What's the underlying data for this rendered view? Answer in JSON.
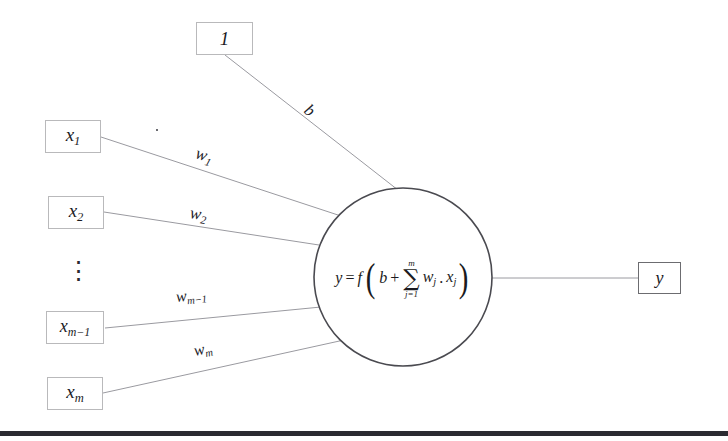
{
  "diagram": {
    "background_color": "#ffffff",
    "line_color": "#9a9aa0",
    "box_border_color": "#b9b9bb",
    "text_color": "#1b1b1f"
  },
  "bias_node": {
    "label": "1",
    "weight_label": "b"
  },
  "inputs": [
    {
      "name": "x",
      "subscript": "1",
      "weight_base": "w",
      "weight_subscript": "1"
    },
    {
      "name": "x",
      "subscript": "2",
      "weight_base": "w",
      "weight_subscript": "2"
    },
    {
      "name": "x",
      "subscript": "m−1",
      "weight_base": "w",
      "weight_subscript": "m−1"
    },
    {
      "name": "x",
      "subscript": "m",
      "weight_base": "w",
      "weight_subscript": "m"
    }
  ],
  "ellipsis": "⋮",
  "neuron": {
    "output_var": "y",
    "equals": "=",
    "function": "f",
    "open_paren": "(",
    "close_paren": ")",
    "bias_term": "b",
    "plus": "+",
    "sum_symbol": "∑",
    "sum_upper": "m",
    "sum_lower": "j=1",
    "weight_term": "w",
    "weight_index": "j",
    "dot": ".",
    "input_term": "x",
    "input_index": "j",
    "formula_plain": "y = f( b + ∑(j=1..m) w_j . x_j )"
  },
  "output_node": {
    "label": "y"
  }
}
